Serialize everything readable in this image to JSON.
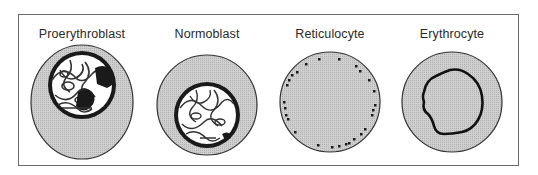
{
  "diagram": {
    "stages": [
      {
        "label": "Proerythroblast",
        "center_x": 82
      },
      {
        "label": "Normoblast",
        "center_x": 207
      },
      {
        "label": "Reticulocyte",
        "center_x": 330
      },
      {
        "label": "Erythrocyte",
        "center_x": 452
      }
    ],
    "colors": {
      "cytoplasm": "#c4c4c4",
      "outline": "#333333",
      "nucleus": "#1a1a1a",
      "chromatin": "#ffffff",
      "frame": "#6a6a6a"
    }
  }
}
